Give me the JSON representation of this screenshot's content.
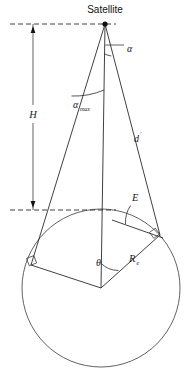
{
  "figure": {
    "title": "Satellite",
    "labels": {
      "height": "H",
      "alpha": "α",
      "alpha_max_base": "α",
      "alpha_max_sub": "max",
      "slant_range": "d",
      "slant_range_prime": "′",
      "elevation": "E",
      "earth_central_angle": "θ",
      "earth_radius_base": "R",
      "earth_radius_sub": "e"
    },
    "colors": {
      "line": "#2b2b2b",
      "text": "#1a1a1a",
      "background": "#ffffff"
    },
    "geometry": {
      "satellite_point": [
        105,
        24
      ],
      "earth_center": [
        101,
        288
      ],
      "earth_radius": 79,
      "nadir_line_top_y": 24,
      "tangent_dash_y": 210,
      "dash_left_x": 10,
      "dash_right_x": 116,
      "dimension_x": 33
    }
  }
}
